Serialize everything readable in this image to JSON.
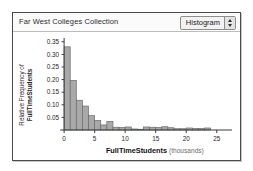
{
  "window": {
    "title": "Far West Colleges Collection"
  },
  "toolbar": {
    "plot_type_value": "Histogram",
    "stepper_up_icon": "triangle-up-icon",
    "stepper_down_icon": "triangle-down-icon"
  },
  "colors": {
    "bar_fill": "#a9a9a9",
    "bar_stroke": "#6b6b6b",
    "axis": "#3a3a3a",
    "window_border": "#4a4a4a",
    "title_bar_bg": "#fbfbfb"
  },
  "chart_data": {
    "type": "bar",
    "title": "Far West Colleges Collection",
    "subtitle": "",
    "xlabel": "FullTimeStudents",
    "xlabel_unit": "(thousands)",
    "ylabel_line1": "Relative Frequency of",
    "ylabel_line2": "FullTimeStudents",
    "xlim": [
      -1,
      27.5
    ],
    "ylim": [
      0,
      0.365
    ],
    "grid": false,
    "legend": null,
    "bin_width": 1,
    "x_ticks": [
      0,
      5,
      10,
      15,
      20,
      25
    ],
    "x_tick_labels": [
      "0",
      "5",
      "10",
      "15",
      "20",
      "25"
    ],
    "y_ticks": [
      0.05,
      0.1,
      0.15,
      0.2,
      0.25,
      0.3,
      0.35
    ],
    "y_tick_labels": [
      "0.05",
      "0.10",
      "0.15",
      "0.20",
      "0.25",
      "0.30",
      "0.35"
    ],
    "bin_starts": [
      0,
      1,
      2,
      3,
      4,
      5,
      6,
      7,
      8,
      9,
      10,
      11,
      12,
      13,
      14,
      15,
      16,
      17,
      18,
      19,
      20,
      21,
      22,
      23
    ],
    "categories": [
      "0-1",
      "1-2",
      "2-3",
      "3-4",
      "4-5",
      "5-6",
      "6-7",
      "7-8",
      "8-9",
      "9-10",
      "10-11",
      "11-12",
      "12-13",
      "13-14",
      "14-15",
      "15-16",
      "16-17",
      "17-18",
      "18-19",
      "19-20",
      "20-21",
      "21-22",
      "22-23",
      "23-24"
    ],
    "values": [
      0.33,
      0.197,
      0.118,
      0.095,
      0.057,
      0.038,
      0.02,
      0.034,
      0.011,
      0.01,
      0.012,
      0.004,
      0.003,
      0.012,
      0.011,
      0.01,
      0.013,
      0.009,
      0.005,
      0.005,
      0.008,
      0.006,
      0.006,
      0.008
    ]
  }
}
